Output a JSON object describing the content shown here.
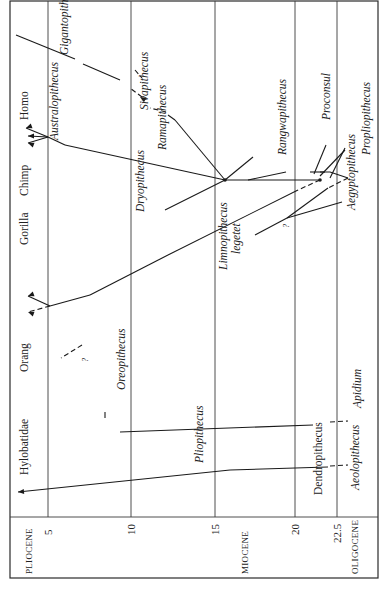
{
  "figure": {
    "epochs": [
      {
        "label": "PLIOCENE",
        "x": 32
      },
      {
        "label": "MIOCENE",
        "x": 248
      },
      {
        "label": "OLIGOCENE",
        "x": 358
      }
    ],
    "axis_ticks": [
      {
        "label": "5",
        "x": 48
      },
      {
        "label": "10",
        "x": 131
      },
      {
        "label": "15",
        "x": 215
      },
      {
        "label": "20",
        "x": 295
      },
      {
        "label": "22.5",
        "x": 337
      }
    ],
    "living_taxa": [
      {
        "label": "Hylobatidae",
        "x": 20,
        "y": 475
      },
      {
        "label": "Orang",
        "x": 20,
        "y": 372
      },
      {
        "label": "Gorilla",
        "x": 20,
        "y": 245
      },
      {
        "label": "Chimp",
        "x": 20,
        "y": 196
      },
      {
        "label": "Homo",
        "x": 20,
        "y": 120
      }
    ],
    "fossil_taxa": [
      {
        "label": "Gigantopithecus",
        "x": 68,
        "y": 55,
        "italic": true
      },
      {
        "label": "Australopithecus",
        "x": 58,
        "y": 140,
        "italic": true
      },
      {
        "label": "Sivapithecus",
        "x": 148,
        "y": 110,
        "italic": true
      },
      {
        "label": "Ramapithecus",
        "x": 166,
        "y": 150,
        "italic": true
      },
      {
        "label": "Dryopithecus",
        "x": 144,
        "y": 212,
        "italic": true
      },
      {
        "label": "Limnopithecus",
        "x": 227,
        "y": 270,
        "italic": true
      },
      {
        "label": "legetet",
        "x": 240,
        "y": 254,
        "italic": true
      },
      {
        "label": "Rangwapithecus",
        "x": 286,
        "y": 155,
        "italic": true
      },
      {
        "label": "Proconsul",
        "x": 330,
        "y": 120,
        "italic": true
      },
      {
        "label": "Aegyptopithecus",
        "x": 355,
        "y": 210,
        "italic": true
      },
      {
        "label": "Propliopithecus",
        "x": 370,
        "y": 155,
        "italic": true
      },
      {
        "label": "Oreopithecus",
        "x": 125,
        "y": 390,
        "italic": true
      },
      {
        "label": "Apidium",
        "x": 361,
        "y": 408,
        "italic": true
      },
      {
        "label": "Pliopithecus",
        "x": 203,
        "y": 463,
        "italic": true
      },
      {
        "label": "Dendropithecus",
        "x": 322,
        "y": 495,
        "italic": false
      },
      {
        "label": "Aeolopithecus",
        "x": 359,
        "y": 490,
        "italic": true
      }
    ],
    "question_marks": [
      {
        "label": "?",
        "x": 88,
        "y": 362
      },
      {
        "label": "?",
        "x": 289,
        "y": 228
      }
    ],
    "branches": [
      {
        "d": "M 320 172 L 330 172 L 348 178",
        "dashed": false
      },
      {
        "d": "M 275 180 L 320 180",
        "dashed": false
      },
      {
        "d": "M 225 180 L 275 180",
        "dashed": false
      },
      {
        "d": "M 225 180 L 175 120",
        "dashed": false
      },
      {
        "d": "M 225 180 L 65 145",
        "dashed": false
      },
      {
        "d": "M 225 180 L 165 210",
        "dashed": false
      },
      {
        "d": "M 225 180 L 253 157",
        "dashed": false
      },
      {
        "d": "M 65 145 L 48 137",
        "dashed": false
      },
      {
        "d": "M 48 137 L 26 128",
        "dashed": false
      },
      {
        "d": "M 48 137 L 28 136",
        "dashed": false
      },
      {
        "d": "M 48 137 L 28 143",
        "dashed": false
      },
      {
        "d": "M 175 120 L 168 115",
        "dashed": false
      },
      {
        "d": "M 166 112 L 150 108",
        "dashed": true
      },
      {
        "d": "M 142 97 L 130 88",
        "dashed": true
      },
      {
        "d": "M 120 80 L 83 64",
        "dashed": false
      },
      {
        "d": "M 75 59 L 16 35",
        "dashed": false
      },
      {
        "d": "M 135 70 L 142 78",
        "dashed": true
      },
      {
        "d": "M 320 180 L 298 190",
        "dashed": true
      },
      {
        "d": "M 298 190 L 168 255",
        "dashed": false
      },
      {
        "d": "M 168 255 L 90 295",
        "dashed": false
      },
      {
        "d": "M 90 295 L 50 306",
        "dashed": false
      },
      {
        "d": "M 50 306 L 28 312",
        "dashed": true
      },
      {
        "d": "M 50 306 L 28 296",
        "dashed": false
      },
      {
        "d": "M 348 178 L 328 188",
        "dashed": true
      },
      {
        "d": "M 328 188 L 287 218",
        "dashed": false
      },
      {
        "d": "M 287 218 L 255 235",
        "dashed": false
      },
      {
        "d": "M 287 218 L 342 202",
        "dashed": false
      },
      {
        "d": "M 310 172 L 325 172",
        "dashed": false
      },
      {
        "d": "M 248 180 L 286 172",
        "dashed": false
      },
      {
        "d": "M 345 148 L 330 178",
        "dashed": false
      },
      {
        "d": "M 326 145 L 314 174",
        "dashed": false
      },
      {
        "d": "M 345 150 L 320 176",
        "dashed": false
      },
      {
        "d": "M 82 345 L 61 358",
        "dashed": true
      },
      {
        "d": "M 313 425 L 120 432",
        "dashed": false
      },
      {
        "d": "M 330 422 L 348 421",
        "dashed": true
      },
      {
        "d": "M 105 412 L 105 418",
        "dashed": false
      },
      {
        "d": "M 328 467 L 230 470",
        "dashed": false
      },
      {
        "d": "M 230 470 L 18 492",
        "dashed": false
      },
      {
        "d": "M 330 466 L 348 465",
        "dashed": true
      }
    ],
    "arrowheads": [
      {
        "x": 18,
        "y": 492,
        "angle": 175
      },
      {
        "x": 28,
        "y": 312,
        "angle": 200
      },
      {
        "x": 28,
        "y": 296,
        "angle": 160
      },
      {
        "x": 26,
        "y": 128,
        "angle": 160
      },
      {
        "x": 28,
        "y": 136,
        "angle": 180
      },
      {
        "x": 28,
        "y": 143,
        "angle": 200
      },
      {
        "x": 140,
        "y": 97,
        "angle": 210
      }
    ],
    "nodes": [
      {
        "x": 225,
        "y": 180
      },
      {
        "x": 320,
        "y": 180
      }
    ]
  }
}
